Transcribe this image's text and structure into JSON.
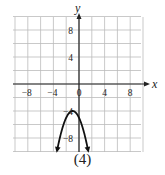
{
  "chart_data": {
    "type": "line",
    "title": "",
    "caption": "(4)",
    "xlabel": "x",
    "ylabel": "y",
    "xlim": [
      -10,
      10
    ],
    "ylim": [
      -10,
      10
    ],
    "grid": true,
    "grid_step": 2,
    "x_ticks": [
      -8,
      -4,
      0,
      4,
      8
    ],
    "y_ticks": [
      8,
      4,
      -4,
      -8
    ],
    "x_tick_labels": [
      "-8",
      "-4",
      "0",
      "4",
      "8"
    ],
    "y_tick_labels": [
      "8",
      "4",
      "-4",
      "-8"
    ],
    "series": [
      {
        "name": "parabola",
        "equation": "y = -(x+1)^2 - 4",
        "vertex": [
          -1,
          -4
        ],
        "opens": "down",
        "arrows_at_ends": true,
        "x": [
          -3.4,
          -3,
          -2.5,
          -2,
          -1.5,
          -1,
          -0.5,
          0,
          0.5,
          1,
          1.4
        ],
        "y": [
          -9.8,
          -8,
          -6.25,
          -5,
          -4.25,
          -4,
          -4.25,
          -5,
          -6.25,
          -8,
          -9.8
        ]
      }
    ]
  }
}
